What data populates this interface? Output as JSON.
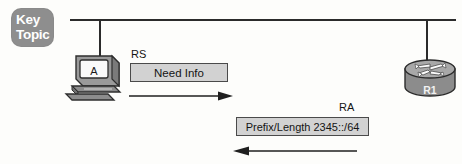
{
  "figure": {
    "type": "network-diagram"
  },
  "key_topic_badge": {
    "line1": "Key",
    "line2": "Topic",
    "background_color": "#8e8e8e",
    "text_color": "#ffffff"
  },
  "nodes": {
    "host": {
      "icon": "pc-workstation-icon",
      "label": "A"
    },
    "router": {
      "icon": "router-icon",
      "label": "R1"
    }
  },
  "network": {
    "bus_icon": "ethernet-bus-line",
    "drop_pc_icon": "drop-line-icon",
    "drop_router_icon": "drop-line-icon"
  },
  "messages": [
    {
      "protocol_label": "RS",
      "box_text": "Need Info",
      "direction": "right",
      "arrow_icon": "arrow-right-icon",
      "box_fill": "#d2d2d2",
      "box_border": "#4a4a4a"
    },
    {
      "protocol_label": "RA",
      "box_text": "Prefix/Length 2345::/64",
      "direction": "left",
      "arrow_icon": "arrow-left-icon",
      "box_fill": "#d2d2d2",
      "box_border": "#4a4a4a"
    }
  ]
}
